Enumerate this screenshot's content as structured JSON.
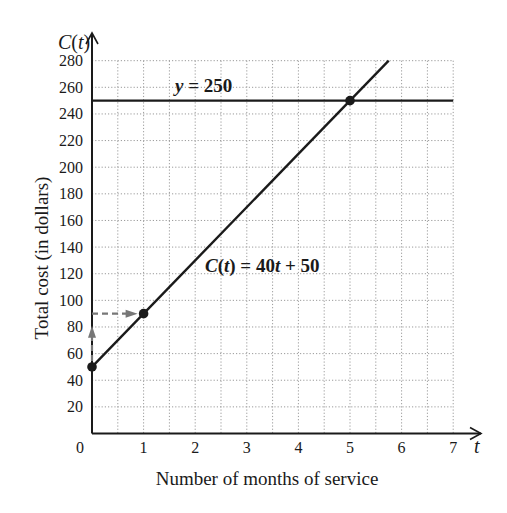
{
  "chart_data": {
    "type": "line",
    "title": "",
    "xlabel": "Number of months of service",
    "ylabel": "Total cost (in dollars)",
    "x_axis_symbol": "t",
    "y_axis_symbol": "C(t)",
    "xlim": [
      0,
      7
    ],
    "ylim": [
      0,
      280
    ],
    "x_ticks": [
      0,
      1,
      2,
      3,
      4,
      5,
      6,
      7
    ],
    "y_ticks": [
      20,
      40,
      60,
      80,
      100,
      120,
      140,
      160,
      180,
      200,
      220,
      240,
      260,
      280
    ],
    "grid": {
      "on": true,
      "style": "dotted",
      "x_step": 0.5,
      "y_step": 20
    },
    "series": [
      {
        "name": "C(t) = 40t + 50",
        "kind": "line",
        "points": [
          [
            0,
            50
          ],
          [
            5.75,
            280
          ]
        ]
      },
      {
        "name": "y = 250",
        "kind": "horizontal",
        "y": 250,
        "x_range": [
          0,
          7
        ]
      }
    ],
    "points": [
      [
        0,
        50
      ],
      [
        1,
        90
      ],
      [
        5,
        250
      ]
    ],
    "annotations": [
      {
        "text": "y = 250",
        "x": 2.2,
        "y": 258
      },
      {
        "text": "C(t) = 40t + 50",
        "x": 2.4,
        "y": 124
      },
      {
        "type": "dashed-arrow",
        "from": [
          0,
          50
        ],
        "to": [
          0,
          90
        ],
        "color": "#777777"
      },
      {
        "type": "dashed-arrow",
        "from": [
          0,
          90
        ],
        "to": [
          1,
          90
        ],
        "color": "#777777"
      }
    ],
    "legend": null
  },
  "labels": {
    "y_symbol_main": "C",
    "y_symbol_paren_open": "(",
    "y_symbol_var": "t",
    "y_symbol_paren_close": ")",
    "x_symbol": "t",
    "xlabel": "Number of months of service",
    "ylabel": "Total cost (in dollars)",
    "eq_horizontal_y": "y",
    "eq_horizontal_rest": " = 250",
    "eq_line_C": "C",
    "eq_line_open": "(",
    "eq_line_t": "t",
    "eq_line_mid": ") = 40",
    "eq_line_t2": "t",
    "eq_line_end": " + 50",
    "x_ticks": [
      "0",
      "1",
      "2",
      "3",
      "4",
      "5",
      "6",
      "7"
    ],
    "y_ticks": [
      "20",
      "40",
      "60",
      "80",
      "100",
      "120",
      "140",
      "160",
      "180",
      "200",
      "220",
      "240",
      "260",
      "280"
    ]
  },
  "colors": {
    "ink": "#1a1a1a",
    "grid": "#9a9a9a",
    "arrow": "#777777"
  }
}
